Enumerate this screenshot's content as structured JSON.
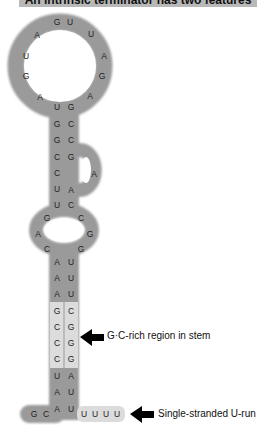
{
  "title": "An intrinsic terminator has two features",
  "colors": {
    "rna_backbone": "#9a9a9a",
    "gc_region": "#dcdcdc",
    "u_run": "#dcdcdc",
    "arrow": "#000000"
  },
  "hairpin_loop": [
    "A",
    "G",
    "U",
    "A",
    "G",
    "U",
    "U",
    "A",
    "G",
    "A"
  ],
  "upper_stem": {
    "left": [
      "U",
      "G",
      "G",
      "C",
      "C",
      "U",
      "U"
    ],
    "right": [
      "G",
      "C",
      "C",
      "G",
      "A",
      "C",
      "C"
    ],
    "right_bulge": [
      "A"
    ]
  },
  "internal_loop": {
    "left": [
      "G",
      "A",
      "C"
    ],
    "right": [
      "C",
      "G",
      "G"
    ]
  },
  "lower_stem": {
    "left": [
      "A",
      "A",
      "A",
      "G",
      "C",
      "C",
      "C",
      "U",
      "A",
      "A"
    ],
    "right": [
      "U",
      "U",
      "U",
      "C",
      "G",
      "G",
      "G",
      "A",
      "U",
      "U"
    ]
  },
  "five_prime_tail": [
    "G",
    "C"
  ],
  "u_run": [
    "U",
    "U",
    "U",
    "U"
  ],
  "annotations": {
    "gc_rich": "G·C-rich region in stem",
    "u_run": "Single-stranded U-run"
  }
}
